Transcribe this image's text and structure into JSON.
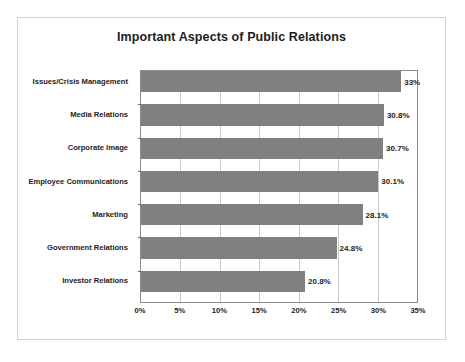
{
  "chart_data": {
    "type": "bar",
    "orientation": "horizontal",
    "title": "Important Aspects of Public Relations",
    "xlabel": "",
    "ylabel": "",
    "categories": [
      "Issues/Crisis Management",
      "Media Relations",
      "Corporate Image",
      "Employee Communications",
      "Marketing",
      "Government Relations",
      "Investor Relations"
    ],
    "values": [
      33.0,
      30.8,
      30.7,
      30.1,
      28.1,
      24.8,
      20.8
    ],
    "value_labels": [
      "33%",
      "30.8%",
      "30.7%",
      "30.1%",
      "28.1%",
      "24.8%",
      "20.8%"
    ],
    "xlim": [
      0,
      35
    ],
    "xticks": [
      0,
      5,
      10,
      15,
      20,
      25,
      30,
      35
    ],
    "xtick_labels": [
      "0%",
      "5%",
      "10%",
      "15%",
      "20%",
      "25%",
      "30%",
      "35%"
    ],
    "grid": "vertical",
    "legend": null,
    "bar_color": "#808080",
    "plot_border_color": "#8c8c8c",
    "gridline_color": "#c9c9c9",
    "text_color": "#1d1d1d",
    "background_color": "#ffffff",
    "frame_color": "#d2d2d2"
  }
}
